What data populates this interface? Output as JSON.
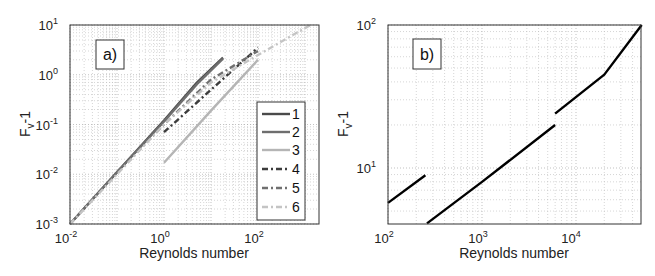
{
  "chart_data": [
    {
      "type": "line",
      "panel_label": "a)",
      "title": "",
      "xlabel": "Reynolds number",
      "ylabel": "F_v-1",
      "xscale": "log",
      "yscale": "log",
      "xlim": [
        0.01,
        2000
      ],
      "ylim": [
        0.001,
        10
      ],
      "x_ticks": [
        "10^-2",
        "10^0",
        "10^2"
      ],
      "y_ticks": [
        "10^-3",
        "10^-2",
        "10^-1",
        "10^0",
        "10^1"
      ],
      "grid": true,
      "legend_position": "right-lower inside",
      "series": [
        {
          "name": "1",
          "style": "solid",
          "color": "#4a4a4a",
          "x": [
            0.01,
            0.1,
            1,
            5,
            18
          ],
          "y": [
            0.001,
            0.011,
            0.12,
            0.7,
            2.2
          ]
        },
        {
          "name": "2",
          "style": "solid",
          "color": "#6e6e6e",
          "x": [
            0.01,
            0.1,
            1,
            5,
            18
          ],
          "y": [
            0.001,
            0.011,
            0.115,
            0.65,
            2.1
          ]
        },
        {
          "name": "3",
          "style": "solid",
          "color": "#b5b5b5",
          "x": [
            1,
            10,
            100
          ],
          "y": [
            0.017,
            0.19,
            2.0
          ]
        },
        {
          "name": "4",
          "style": "dash-dot",
          "color": "#3c3c3c",
          "x": [
            1,
            10,
            100
          ],
          "y": [
            0.07,
            0.5,
            3.5
          ]
        },
        {
          "name": "5",
          "style": "dash-dot",
          "color": "#707070",
          "x": [
            0.1,
            1,
            10,
            100
          ],
          "y": [
            0.011,
            0.1,
            0.8,
            3.0
          ]
        },
        {
          "name": "6",
          "style": "dash-dot",
          "color": "#c4c4c4",
          "x": [
            0.01,
            0.1,
            1,
            10,
            100,
            1300
          ],
          "y": [
            0.001,
            0.01,
            0.1,
            0.7,
            2.5,
            10
          ]
        }
      ]
    },
    {
      "type": "line",
      "panel_label": "b)",
      "title": "",
      "xlabel": "Reynolds number",
      "ylabel": "F_v-1",
      "xscale": "log",
      "yscale": "log",
      "xlim": [
        100,
        50000
      ],
      "ylim": [
        4,
        100
      ],
      "x_ticks": [
        "10^2",
        "10^3",
        "10^4"
      ],
      "y_ticks": [
        "10^1",
        "10^2"
      ],
      "grid": true,
      "series": [
        {
          "name": "segment-1",
          "style": "solid",
          "color": "#000000",
          "x": [
            100,
            250
          ],
          "y": [
            5.7,
            8.9
          ]
        },
        {
          "name": "segment-2",
          "style": "solid",
          "color": "#000000",
          "x": [
            260,
            1000,
            6000
          ],
          "y": [
            4.1,
            8.0,
            20
          ]
        },
        {
          "name": "segment-3",
          "style": "solid",
          "color": "#000000",
          "x": [
            6000,
            20000,
            50000
          ],
          "y": [
            24,
            45,
            100
          ]
        }
      ]
    }
  ],
  "panels": {
    "a": {
      "label": "a)",
      "xlabel": "Reynolds number",
      "ylabel_main": "F",
      "ylabel_sub": "v",
      "ylabel_tail": "-1",
      "xticks": [
        {
          "base": "10",
          "exp": "-2"
        },
        {
          "base": "10",
          "exp": "0"
        },
        {
          "base": "10",
          "exp": "2"
        }
      ],
      "yticks": [
        {
          "base": "10",
          "exp": "1"
        },
        {
          "base": "10",
          "exp": "0"
        },
        {
          "base": "10",
          "exp": "-1"
        },
        {
          "base": "10",
          "exp": "-2"
        },
        {
          "base": "10",
          "exp": "-3"
        }
      ],
      "legend": [
        "1",
        "2",
        "3",
        "4",
        "5",
        "6"
      ]
    },
    "b": {
      "label": "b)",
      "xlabel": "Reynolds number",
      "ylabel_main": "F",
      "ylabel_sub": "v",
      "ylabel_tail": "-1",
      "xticks": [
        {
          "base": "10",
          "exp": "2"
        },
        {
          "base": "10",
          "exp": "3"
        },
        {
          "base": "10",
          "exp": "4"
        }
      ],
      "yticks": [
        {
          "base": "10",
          "exp": "2"
        },
        {
          "base": "10",
          "exp": "1"
        }
      ]
    }
  }
}
